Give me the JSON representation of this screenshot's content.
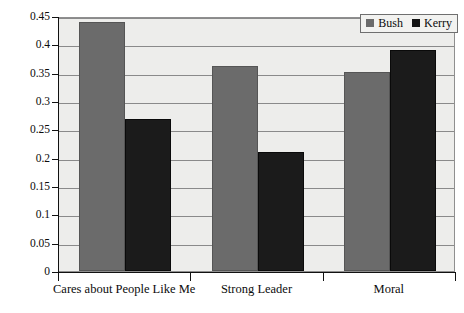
{
  "chart_data": {
    "type": "bar",
    "title": "",
    "subtitle": "",
    "xlabel": "",
    "ylabel": "",
    "categories": [
      "Cares about People Like Me",
      "Strong Leader",
      "Moral"
    ],
    "series": [
      {
        "name": "Bush",
        "color": "#6b6b6b",
        "values": [
          0.44,
          0.362,
          0.351
        ]
      },
      {
        "name": "Kerry",
        "color": "#1b1b1b",
        "values": [
          0.268,
          0.21,
          0.39
        ]
      }
    ],
    "ylim": [
      0,
      0.45
    ],
    "ytick_step": 0.05,
    "ytick_labels": [
      "0",
      "0.05",
      "0.1",
      "0.15",
      "0.2",
      "0.25",
      "0.3",
      "0.35",
      "0.4",
      "0.45"
    ],
    "ytick_values": [
      0,
      0.05,
      0.1,
      0.15,
      0.2,
      0.25,
      0.3,
      0.35,
      0.4,
      0.45
    ],
    "grid": true,
    "grid_axis": "y",
    "legend_position": "top-right",
    "legend_entries": [
      "Bush",
      "Kerry"
    ],
    "plot_background": "#ededeb",
    "grid_color": "#8a8a8a",
    "axis_color": "#111111"
  }
}
